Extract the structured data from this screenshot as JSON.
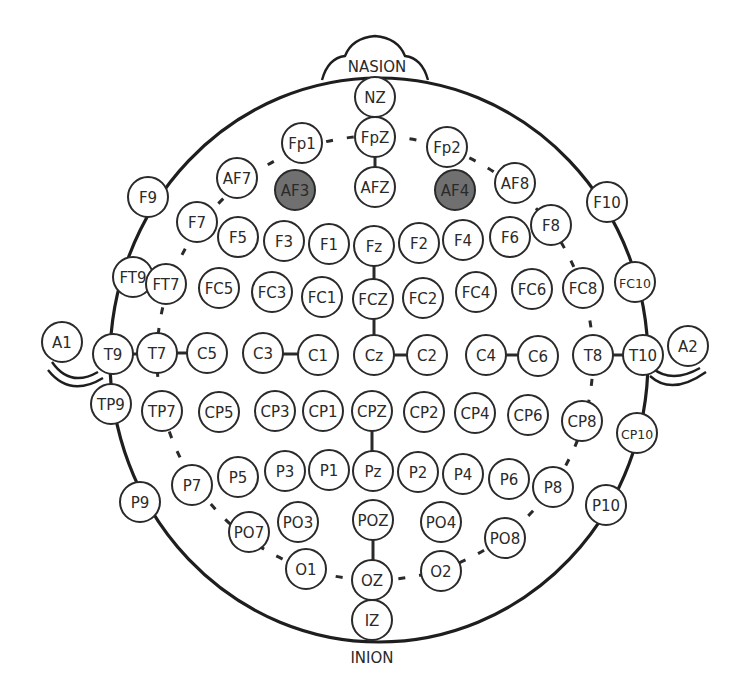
{
  "diagram": {
    "landmarks": {
      "top": "NASION",
      "bottom": "INION"
    },
    "highlight_color": "#707070",
    "electrodes": [
      {
        "label": "NZ",
        "x": 375,
        "y": 97
      },
      {
        "label": "FpZ",
        "x": 375,
        "y": 137
      },
      {
        "label": "Fp1",
        "x": 302,
        "y": 143
      },
      {
        "label": "Fp2",
        "x": 447,
        "y": 147
      },
      {
        "label": "AF7",
        "x": 237,
        "y": 178
      },
      {
        "label": "AF3",
        "x": 295,
        "y": 190,
        "active": true
      },
      {
        "label": "AFZ",
        "x": 375,
        "y": 187
      },
      {
        "label": "AF4",
        "x": 455,
        "y": 190,
        "active": true
      },
      {
        "label": "AF8",
        "x": 515,
        "y": 183
      },
      {
        "label": "F9",
        "x": 148,
        "y": 197
      },
      {
        "label": "F10",
        "x": 607,
        "y": 202
      },
      {
        "label": "F7",
        "x": 197,
        "y": 222
      },
      {
        "label": "F5",
        "x": 238,
        "y": 237
      },
      {
        "label": "F3",
        "x": 284,
        "y": 241
      },
      {
        "label": "F1",
        "x": 329,
        "y": 244
      },
      {
        "label": "Fz",
        "x": 374,
        "y": 246
      },
      {
        "label": "F2",
        "x": 419,
        "y": 243
      },
      {
        "label": "F4",
        "x": 463,
        "y": 240
      },
      {
        "label": "F6",
        "x": 510,
        "y": 237
      },
      {
        "label": "F8",
        "x": 551,
        "y": 225
      },
      {
        "label": "FT9",
        "x": 133,
        "y": 277
      },
      {
        "label": "FT7",
        "x": 166,
        "y": 284
      },
      {
        "label": "FC5",
        "x": 219,
        "y": 288
      },
      {
        "label": "FC3",
        "x": 272,
        "y": 292
      },
      {
        "label": "FC1",
        "x": 322,
        "y": 297
      },
      {
        "label": "FCZ",
        "x": 373,
        "y": 299
      },
      {
        "label": "FC2",
        "x": 423,
        "y": 298
      },
      {
        "label": "FC4",
        "x": 476,
        "y": 292
      },
      {
        "label": "FC6",
        "x": 532,
        "y": 289
      },
      {
        "label": "FC8",
        "x": 583,
        "y": 288
      },
      {
        "label": "FC10",
        "x": 635,
        "y": 282,
        "small": true
      },
      {
        "label": "A1",
        "x": 62,
        "y": 342
      },
      {
        "label": "T9",
        "x": 113,
        "y": 354
      },
      {
        "label": "T7",
        "x": 157,
        "y": 353
      },
      {
        "label": "C5",
        "x": 207,
        "y": 353
      },
      {
        "label": "C3",
        "x": 263,
        "y": 353
      },
      {
        "label": "C1",
        "x": 318,
        "y": 355
      },
      {
        "label": "Cz",
        "x": 374,
        "y": 355
      },
      {
        "label": "C2",
        "x": 427,
        "y": 355
      },
      {
        "label": "C4",
        "x": 486,
        "y": 355
      },
      {
        "label": "C6",
        "x": 538,
        "y": 356
      },
      {
        "label": "T8",
        "x": 593,
        "y": 355
      },
      {
        "label": "T10",
        "x": 643,
        "y": 355
      },
      {
        "label": "A2",
        "x": 688,
        "y": 346
      },
      {
        "label": "TP9",
        "x": 111,
        "y": 404
      },
      {
        "label": "TP7",
        "x": 162,
        "y": 411
      },
      {
        "label": "CP5",
        "x": 219,
        "y": 412
      },
      {
        "label": "CP3",
        "x": 275,
        "y": 411
      },
      {
        "label": "CP1",
        "x": 323,
        "y": 411
      },
      {
        "label": "CPZ",
        "x": 372,
        "y": 411
      },
      {
        "label": "CP2",
        "x": 424,
        "y": 412
      },
      {
        "label": "CP4",
        "x": 475,
        "y": 413
      },
      {
        "label": "CP6",
        "x": 528,
        "y": 415
      },
      {
        "label": "CP8",
        "x": 582,
        "y": 421
      },
      {
        "label": "CP10",
        "x": 637,
        "y": 433,
        "small": true
      },
      {
        "label": "P9",
        "x": 140,
        "y": 502
      },
      {
        "label": "P7",
        "x": 192,
        "y": 485
      },
      {
        "label": "P5",
        "x": 238,
        "y": 477
      },
      {
        "label": "P3",
        "x": 285,
        "y": 471
      },
      {
        "label": "P1",
        "x": 329,
        "y": 470
      },
      {
        "label": "Pz",
        "x": 373,
        "y": 471
      },
      {
        "label": "P2",
        "x": 418,
        "y": 472
      },
      {
        "label": "P4",
        "x": 463,
        "y": 474
      },
      {
        "label": "P6",
        "x": 509,
        "y": 479
      },
      {
        "label": "P8",
        "x": 553,
        "y": 487
      },
      {
        "label": "P10",
        "x": 606,
        "y": 505
      },
      {
        "label": "PO7",
        "x": 249,
        "y": 532
      },
      {
        "label": "PO3",
        "x": 298,
        "y": 522
      },
      {
        "label": "POZ",
        "x": 373,
        "y": 520
      },
      {
        "label": "PO4",
        "x": 441,
        "y": 522
      },
      {
        "label": "PO8",
        "x": 505,
        "y": 538
      },
      {
        "label": "O1",
        "x": 306,
        "y": 569
      },
      {
        "label": "OZ",
        "x": 372,
        "y": 580
      },
      {
        "label": "O2",
        "x": 441,
        "y": 571
      },
      {
        "label": "IZ",
        "x": 372,
        "y": 620
      }
    ]
  }
}
